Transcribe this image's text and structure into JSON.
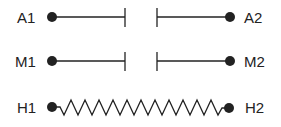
{
  "rows": [
    {
      "left_label": "A1",
      "right_label": "A2",
      "type": "open-contact"
    },
    {
      "left_label": "M1",
      "right_label": "M2",
      "type": "open-contact"
    },
    {
      "left_label": "H1",
      "right_label": "H2",
      "type": "resistor"
    }
  ],
  "colors": {
    "stroke": "#222222",
    "background": "#ffffff"
  }
}
